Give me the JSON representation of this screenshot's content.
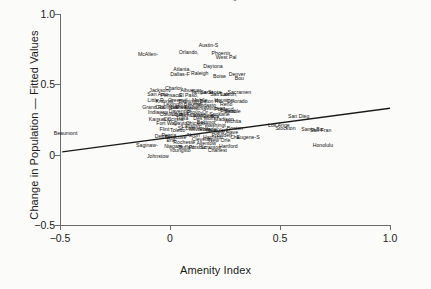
{
  "chart_data": {
    "type": "scatter",
    "title": "",
    "xlabel": "Amenity Index",
    "ylabel": "Change in Population — Fitted Values",
    "xlim": [
      -0.5,
      1.0
    ],
    "ylim": [
      -0.5,
      1.0
    ],
    "xticks": [
      "-0.5",
      "0",
      "0.5",
      "1.0"
    ],
    "xtick_values": [
      -0.5,
      0,
      0.5,
      1.0
    ],
    "yticks": [
      "-0.5",
      "0",
      "0.5",
      "1.0"
    ],
    "ytick_values": [
      -0.5,
      0,
      0.5,
      1.0
    ],
    "grid": false,
    "legend": "none",
    "marker_style": "text-label",
    "fit_line": {
      "label": "fitted regression line",
      "x": [
        -0.49,
        1.0
      ],
      "y": [
        0.02,
        0.33
      ],
      "color": "#1a1a1a"
    },
    "points": [
      {
        "label": "Las Vega",
        "x": 0.265,
        "y": 1.11
      },
      {
        "label": "Austin-S",
        "x": 0.175,
        "y": 0.77
      },
      {
        "label": "McAllen-",
        "x": -0.1,
        "y": 0.705
      },
      {
        "label": "Orlando,",
        "x": 0.085,
        "y": 0.725
      },
      {
        "label": "Phoenix,",
        "x": 0.235,
        "y": 0.715
      },
      {
        "label": "West Pal",
        "x": 0.255,
        "y": 0.685
      },
      {
        "label": "Atlanta,",
        "x": 0.055,
        "y": 0.605
      },
      {
        "label": "Daytona",
        "x": 0.195,
        "y": 0.625
      },
      {
        "label": "Dallas-F",
        "x": 0.045,
        "y": 0.565
      },
      {
        "label": "Raleigh",
        "x": 0.135,
        "y": 0.575
      },
      {
        "label": "Boise",
        "x": 0.225,
        "y": 0.555
      },
      {
        "label": "Denver",
        "x": 0.305,
        "y": 0.565
      },
      {
        "label": "Bou",
        "x": 0.315,
        "y": 0.535
      },
      {
        "label": "Charlot",
        "x": 0.015,
        "y": 0.465
      },
      {
        "label": "Jacksonv",
        "x": -0.045,
        "y": 0.455
      },
      {
        "label": "Albuquer",
        "x": 0.095,
        "y": 0.455
      },
      {
        "label": "Tampa-St",
        "x": 0.145,
        "y": 0.435
      },
      {
        "label": "San Anto",
        "x": -0.055,
        "y": 0.425
      },
      {
        "label": "Pensacol",
        "x": 0.005,
        "y": 0.415
      },
      {
        "label": "El Paso,",
        "x": 0.085,
        "y": 0.415
      },
      {
        "label": "Sarasota",
        "x": 0.185,
        "y": 0.435
      },
      {
        "label": "Salt Lak",
        "x": 0.225,
        "y": 0.425
      },
      {
        "label": "Tucson,",
        "x": 0.265,
        "y": 0.425
      },
      {
        "label": "Sacramen",
        "x": 0.315,
        "y": 0.435
      },
      {
        "label": "Grand Ra",
        "x": -0.075,
        "y": 0.335
      },
      {
        "label": "Columbia",
        "x": -0.015,
        "y": 0.335
      },
      {
        "label": "Nashvill",
        "x": 0.035,
        "y": 0.335
      },
      {
        "label": "Greensbo",
        "x": 0.075,
        "y": 0.335
      },
      {
        "label": "Memphis",
        "x": 0.115,
        "y": 0.325
      },
      {
        "label": "Minneap",
        "x": 0.205,
        "y": 0.325
      },
      {
        "label": "Portland",
        "x": 0.245,
        "y": 0.315
      },
      {
        "label": "Seattle",
        "x": 0.285,
        "y": 0.305
      },
      {
        "label": "Indianap",
        "x": -0.055,
        "y": 0.295
      },
      {
        "label": "Columbus",
        "x": 0.005,
        "y": 0.285
      },
      {
        "label": "Louisvil",
        "x": 0.045,
        "y": 0.285
      },
      {
        "label": "Richmond",
        "x": 0.095,
        "y": 0.275
      },
      {
        "label": "Oklahoma",
        "x": 0.145,
        "y": 0.275
      },
      {
        "label": "Omaha",
        "x": 0.185,
        "y": 0.265
      },
      {
        "label": "Kansas C",
        "x": -0.045,
        "y": 0.245
      },
      {
        "label": "Cincinna",
        "x": 0.015,
        "y": 0.245
      },
      {
        "label": "Fort Way",
        "x": -0.015,
        "y": 0.215
      },
      {
        "label": "Dayton",
        "x": 0.055,
        "y": 0.215
      },
      {
        "label": "Chicago",
        "x": 0.115,
        "y": 0.215
      },
      {
        "label": "Baltimor",
        "x": 0.165,
        "y": 0.225
      },
      {
        "label": "Washingt",
        "x": 0.205,
        "y": 0.205
      },
      {
        "label": "St. Loui",
        "x": 0.075,
        "y": 0.185
      },
      {
        "label": "Milwauke",
        "x": 0.135,
        "y": 0.175
      },
      {
        "label": "Philadel",
        "x": 0.175,
        "y": 0.175
      },
      {
        "label": "New York",
        "x": 0.215,
        "y": 0.165
      },
      {
        "label": "New Have",
        "x": 0.255,
        "y": 0.155
      },
      {
        "label": "Detroit",
        "x": -0.035,
        "y": 0.125
      },
      {
        "label": "Syracuse",
        "x": 0.025,
        "y": 0.115
      },
      {
        "label": "Clevelan",
        "x": 0.145,
        "y": 0.105
      },
      {
        "label": "New Orle",
        "x": 0.225,
        "y": 0.095
      },
      {
        "label": "Cha",
        "x": 0.295,
        "y": 0.115
      },
      {
        "label": "Saginaw-",
        "x": -0.105,
        "y": 0.065
      },
      {
        "label": "Niagara",
        "x": 0.015,
        "y": 0.055
      },
      {
        "label": "Buffalo",
        "x": 0.075,
        "y": 0.045
      },
      {
        "label": "Pittsbur",
        "x": 0.125,
        "y": 0.045
      },
      {
        "label": "Scranton",
        "x": 0.185,
        "y": 0.045
      },
      {
        "label": "Youngsto",
        "x": 0.045,
        "y": 0.025
      },
      {
        "label": "Charlest",
        "x": 0.215,
        "y": 0.025
      },
      {
        "label": "Johnstow",
        "x": -0.055,
        "y": -0.015
      },
      {
        "label": "Beaumont",
        "x": -0.475,
        "y": 0.145
      },
      {
        "label": "Eugene-S",
        "x": 0.355,
        "y": 0.115
      },
      {
        "label": "San Dieg",
        "x": 0.585,
        "y": 0.265
      },
      {
        "label": "Los Ange",
        "x": 0.495,
        "y": 0.205
      },
      {
        "label": "Santa Ba",
        "x": 0.645,
        "y": 0.175
      },
      {
        "label": "San Fran",
        "x": 0.685,
        "y": 0.165
      },
      {
        "label": "Honolulu",
        "x": 0.695,
        "y": 0.065
      },
      {
        "label": "Stockton",
        "x": 0.525,
        "y": 0.185
      },
      {
        "label": "Fresno",
        "x": 0.265,
        "y": 0.305
      },
      {
        "label": "Modesto",
        "x": 0.165,
        "y": 0.345
      },
      {
        "label": "Reno",
        "x": 0.255,
        "y": 0.355
      },
      {
        "label": "Bakersfi",
        "x": 0.105,
        "y": 0.355
      },
      {
        "label": "Provo-Or",
        "x": 0.125,
        "y": 0.295
      },
      {
        "label": "Tulsa",
        "x": 0.055,
        "y": 0.255
      },
      {
        "label": "Wichita",
        "x": 0.285,
        "y": 0.235
      },
      {
        "label": "Madison",
        "x": 0.245,
        "y": 0.245
      },
      {
        "label": "Lansing",
        "x": 0.095,
        "y": 0.195
      },
      {
        "label": "Toledo",
        "x": 0.035,
        "y": 0.165
      },
      {
        "label": "Akron",
        "x": 0.105,
        "y": 0.135
      },
      {
        "label": "Rocheste",
        "x": 0.065,
        "y": 0.085
      },
      {
        "label": "Allentow",
        "x": 0.165,
        "y": 0.075
      },
      {
        "label": "Hartford",
        "x": 0.265,
        "y": 0.055
      },
      {
        "label": "Erie",
        "x": 0.005,
        "y": 0.095
      },
      {
        "label": "Flint",
        "x": -0.025,
        "y": 0.175
      },
      {
        "label": "Peoria",
        "x": -0.005,
        "y": 0.135
      },
      {
        "label": "Davenpor",
        "x": 0.045,
        "y": 0.305
      },
      {
        "label": "Des Moin",
        "x": 0.155,
        "y": 0.255
      },
      {
        "label": "Spokane",
        "x": 0.225,
        "y": 0.285
      },
      {
        "label": "Boston",
        "x": 0.295,
        "y": 0.185
      },
      {
        "label": "Providen",
        "x": 0.235,
        "y": 0.135
      },
      {
        "label": "Harrisbu",
        "x": 0.195,
        "y": 0.115
      },
      {
        "label": "Knoxvill",
        "x": -0.025,
        "y": 0.375
      },
      {
        "label": "Greenvil",
        "x": 0.035,
        "y": 0.385
      },
      {
        "label": "Birmingh",
        "x": 0.085,
        "y": 0.375
      },
      {
        "label": "Mobile",
        "x": 0.135,
        "y": 0.385
      },
      {
        "label": "Baton Ro",
        "x": 0.185,
        "y": 0.375
      },
      {
        "label": "Little R",
        "x": -0.065,
        "y": 0.385
      },
      {
        "label": "Houston",
        "x": 0.245,
        "y": 0.385
      },
      {
        "label": "Colorado",
        "x": 0.305,
        "y": 0.375
      },
      {
        "label": "Lexingto",
        "x": 0.015,
        "y": 0.355
      }
    ]
  }
}
